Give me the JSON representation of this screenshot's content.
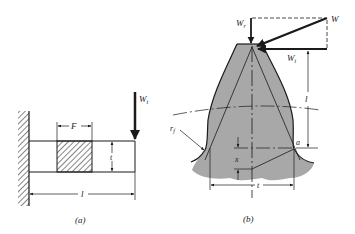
{
  "figure": {
    "panels": [
      {
        "id": "a",
        "caption": "(a)",
        "description": "Cantilever beam fixed to a wall with tip load",
        "labels": {
          "load": "W",
          "load_sub": "t",
          "width": "F",
          "thickness": "t",
          "length": "l"
        }
      },
      {
        "id": "b",
        "caption": "(b)",
        "description": "Gear tooth with force components and inscribed parabola",
        "labels": {
          "radial_force": "W",
          "radial_force_sub": "r",
          "total_force": "W",
          "tangential_force": "W",
          "tangential_force_sub": "t",
          "height": "l",
          "fillet_radius": "r",
          "fillet_radius_sub": "f",
          "point": "a",
          "offset": "x",
          "thickness": "t"
        }
      }
    ],
    "colors": {
      "line": "#1a1a1a",
      "tooth_fill": "#a8a8a8",
      "hatch": "#333333",
      "background": "#ffffff"
    }
  }
}
